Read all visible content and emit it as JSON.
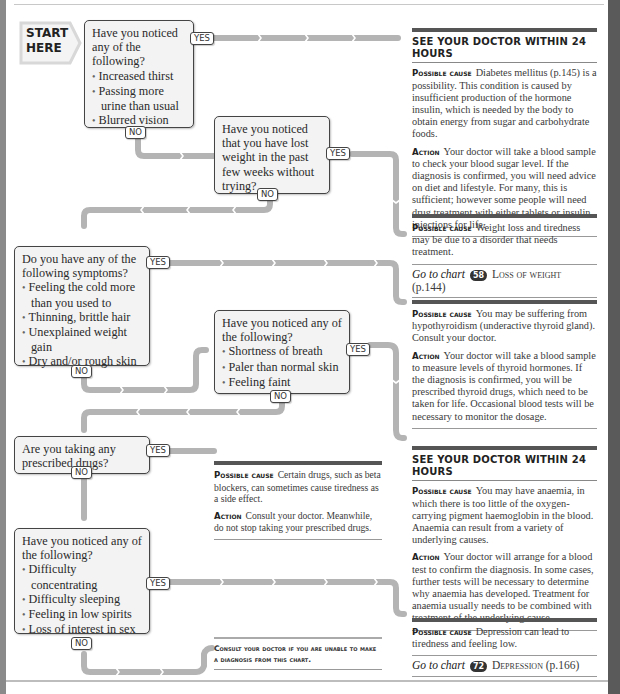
{
  "start": {
    "line1": "START",
    "line2": "HERE"
  },
  "labels": {
    "yes": "YES",
    "no": "NO"
  },
  "colors": {
    "connector": "#b4b4b4",
    "box_fill": "#f3f3f3",
    "box_border": "#444444",
    "rule_dark": "#555555"
  },
  "questions": [
    {
      "id": "q1",
      "text": "Have you noticed any of the following?",
      "items": [
        "Increased thirst",
        "Passing more urine than usual",
        "Blurred vision"
      ]
    },
    {
      "id": "q2",
      "text": "Have you noticed that you have lost weight in the past few weeks without trying?",
      "items": []
    },
    {
      "id": "q3",
      "text": "Do you have any of the following symptoms?",
      "items": [
        "Feeling the cold more than you used to",
        "Thinning, brittle hair",
        "Unexplained weight gain",
        "Dry and/or rough skin"
      ]
    },
    {
      "id": "q4",
      "text": "Have you noticed any of the following?",
      "items": [
        "Shortness of breath",
        "Paler than normal skin",
        "Feeling faint"
      ]
    },
    {
      "id": "q5",
      "text": "Are you taking any prescribed drugs?",
      "items": []
    },
    {
      "id": "q6",
      "text": "Have you noticed any of the following?",
      "items": [
        "Difficulty concentrating",
        "Difficulty sleeping",
        "Feeling in low spirits",
        "Loss of interest in sex"
      ]
    }
  ],
  "results": [
    {
      "header": "SEE YOUR DOCTOR WITHIN 24 HOURS",
      "cause_label": "Possible cause",
      "cause": "Diabetes mellitus (p.145) is a possibility. This condition is caused by insufficient production of the hormone insulin, which is needed by the body to obtain energy from sugar and carbohydrate foods.",
      "action_label": "Action",
      "action": "Your doctor will take a blood sample to check your blood sugar level. If the diagnosis is confirmed, you will need advice on diet and lifestyle. For many, this is sufficient; however some people will need drug treatment with either tablets or insulin injections for life."
    },
    {
      "cause_label": "Possible cause",
      "cause": "Weight loss and tiredness may be due to a disorder that needs treatment.",
      "goto_prefix": "Go to chart",
      "goto_number": "58",
      "goto_title": "Loss of weight",
      "goto_page": "(p.144)"
    },
    {
      "cause_label": "Possible cause",
      "cause": "You may be suffering from hypothyroidism (underactive thyroid gland). Consult your doctor.",
      "action_label": "Action",
      "action": "Your doctor will take a blood sample to measure levels of thyroid hormones. If the diagnosis is confirmed, you will be prescribed thyroid drugs, which need to be taken for life. Occasional blood tests will be necessary to monitor the dosage."
    },
    {
      "header": "SEE YOUR DOCTOR WITHIN 24 HOURS",
      "cause_label": "Possible cause",
      "cause": "You may have anaemia, in which there is too little of the oxygen-carrying pigment haemoglobin in the blood. Anaemia can result from a variety of underlying causes.",
      "action_label": "Action",
      "action": "Your doctor will arrange for a blood test to confirm the diagnosis. In some cases, further tests will be necessary to determine why anaemia has developed. Treatment for anaemia usually needs to be combined with treatment of the underlying cause."
    },
    {
      "cause_label": "Possible cause",
      "cause": "Certain drugs, such as beta blockers, can sometimes cause tiredness as a side effect.",
      "action_label": "Action",
      "action": "Consult your doctor. Meanwhile, do not stop taking your prescribed drugs."
    },
    {
      "cause_label": "Possible cause",
      "cause": "Depression can lead to tiredness and feeling low.",
      "goto_prefix": "Go to chart",
      "goto_number": "72",
      "goto_title": "Depression",
      "goto_page": "(p.166)"
    }
  ],
  "consult": {
    "text": "Consult your doctor if you are unable to make a diagnosis from this chart."
  }
}
